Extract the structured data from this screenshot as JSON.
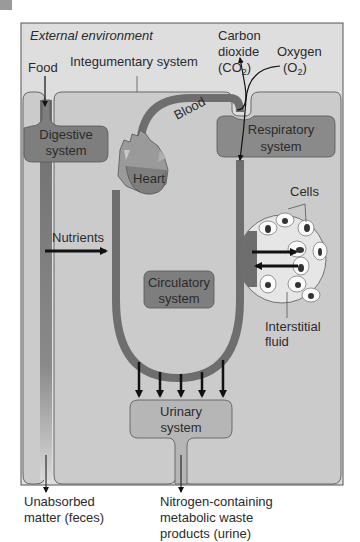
{
  "colors": {
    "environment_bg": "#dedede",
    "body_bg": "#cbcbcb",
    "system_box": "#7e7e7e",
    "circulatory_tube": "#6e6e6e",
    "cell_circle": "#e6e6e6",
    "arrow": "#111111",
    "corner_tab": "#9a9a9a"
  },
  "labels": {
    "external_environment": "External environment",
    "food": "Food",
    "integumentary_system": "Integumentary system",
    "carbon_dioxide_line1": "Carbon",
    "carbon_dioxide_line2": "dioxide",
    "co2_formula": "(CO",
    "co2_sub": "2",
    "co2_close": ")",
    "oxygen": "Oxygen",
    "o2_formula": "(O",
    "o2_sub": "2",
    "o2_close": ")",
    "digestive_line1": "Digestive",
    "digestive_line2": "system",
    "respiratory_line1": "Respiratory",
    "respiratory_line2": "system",
    "blood": "Blood",
    "heart": "Heart",
    "cells": "Cells",
    "nutrients": "Nutrients",
    "circulatory_line1": "Circulatory",
    "circulatory_line2": "system",
    "interstitial_line1": "Interstitial",
    "interstitial_line2": "fluid",
    "urinary_line1": "Urinary",
    "urinary_line2": "system",
    "feces_line1": "Unabsorbed",
    "feces_line2": "matter (feces)",
    "urine_line1": "Nitrogen-containing",
    "urine_line2": "metabolic waste",
    "urine_line3": "products (urine)"
  }
}
